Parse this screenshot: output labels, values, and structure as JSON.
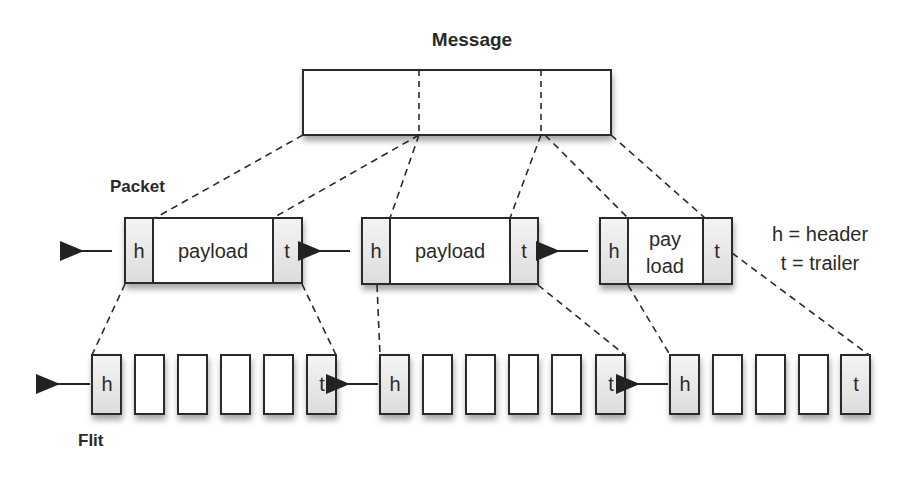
{
  "title": "Message",
  "labels": {
    "packet": "Packet",
    "flit": "Flit"
  },
  "legend": {
    "header": "h = header",
    "trailer": "t = trailer"
  },
  "packets": [
    {
      "h": "h",
      "payload": "payload",
      "t": "t"
    },
    {
      "h": "h",
      "payload": "payload",
      "t": "t"
    },
    {
      "h": "h",
      "payload_line1": "pay",
      "payload_line2": "load",
      "t": "t"
    }
  ],
  "flits": {
    "head": "h",
    "tail": "t"
  },
  "colors": {
    "stroke": "#2a2a2a",
    "shade": "#e6e6e6"
  }
}
